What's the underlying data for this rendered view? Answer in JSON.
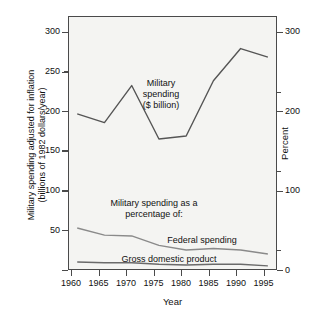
{
  "chart_data": {
    "type": "line",
    "title": "",
    "xlabel": "Year",
    "ylabel": "Military spending adjusted for inflation (billions of 1982 dollars/year)",
    "ylabel_line1": "Military spending adjusted for inflation",
    "ylabel_line2": "(billions of 1982 dollars/year)",
    "y2label": "Percent",
    "x": [
      1960,
      1965,
      1970,
      1975,
      1980,
      1985,
      1990,
      1995
    ],
    "xtick_labels": [
      "1960",
      "1965",
      "1970",
      "1975",
      "1980",
      "1985",
      "1990",
      "1995"
    ],
    "xlim": [
      1958.5,
      1996.5
    ],
    "ylim": [
      0,
      320
    ],
    "ytick_labels": [
      "50",
      "100",
      "150",
      "200",
      "250",
      "300"
    ],
    "yticks": [
      50,
      100,
      150,
      200,
      250,
      300
    ],
    "y_minor_ticks": [
      25,
      75,
      125,
      175,
      225,
      275
    ],
    "y2lim": [
      0,
      320
    ],
    "y2tick_labels": [
      "0",
      "100",
      "200",
      "300"
    ],
    "y2ticks": [
      0,
      100,
      200,
      300
    ],
    "y2_minor_ticks": [
      50,
      150,
      250
    ],
    "grid": false,
    "legend_position": "inline-annotations",
    "series": [
      {
        "name": "Military spending ($ billion)",
        "axis": "left",
        "units": "billions of 1982 dollars/year",
        "values": [
          197,
          186,
          233,
          165,
          169,
          239,
          280,
          269
        ],
        "color": "#555555"
      },
      {
        "name": "Federal spending",
        "axis": "right",
        "units": "percent",
        "values": [
          52,
          43,
          42,
          30,
          24,
          26,
          24,
          19
        ],
        "color": "#8a8a8a"
      },
      {
        "name": "Gross domestic product",
        "axis": "right",
        "units": "percent",
        "values": [
          9,
          8,
          8,
          6,
          5,
          6,
          6,
          4
        ],
        "color": "#6a6a6a"
      }
    ],
    "annotations": [
      {
        "name": "military-spending-label",
        "lines": [
          "Military",
          "spending",
          "($ billion)"
        ]
      },
      {
        "name": "percentage-of-label",
        "lines": [
          "Military spending as a",
          "percentage of:"
        ]
      },
      {
        "name": "federal-spending-label",
        "text": "Federal spending"
      },
      {
        "name": "gross-domestic-product-label",
        "text": "Gross domestic product"
      }
    ],
    "colors": {
      "plot_background": "#f4f4f2",
      "frame": "#4a4a4a",
      "text": "#111111",
      "military_line": "#555555",
      "federal_line": "#8a8a8a",
      "gdp_line": "#6a6a6a"
    }
  },
  "annotations": {
    "military_l1": "Military",
    "military_l2": "spending",
    "military_l3": "($ billion)",
    "pct_l1": "Military spending as a",
    "pct_l2": "percentage of:",
    "federal": "Federal spending",
    "gdp": "Gross domestic product"
  },
  "axes": {
    "left_title_l1": "Military spending adjusted for inflation",
    "left_title_l2": "(billions of 1982 dollars/year)",
    "right_title": "Percent",
    "x_title": "Year",
    "y_left": {
      "t300": "300",
      "t250": "250",
      "t200": "200",
      "t150": "150",
      "t100": "100",
      "t50": "50"
    },
    "y_right": {
      "t300": "300",
      "t200": "200",
      "t100": "100",
      "t0": "0"
    },
    "x_ticks": {
      "x1960": "1960",
      "x1965": "1965",
      "x1970": "1970",
      "x1975": "1975",
      "x1980": "1980",
      "x1985": "1985",
      "x1990": "1990",
      "x1995": "1995"
    }
  }
}
